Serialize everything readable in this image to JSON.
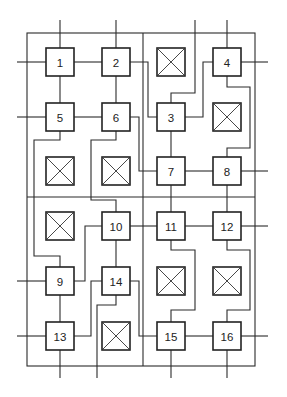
{
  "diagram": {
    "type": "grid-interconnect",
    "frame": {
      "left": 27,
      "top": 33,
      "right": 255,
      "bottom": 366,
      "divider_x": 143,
      "divider_y": 197
    },
    "box_size": 28,
    "nodes": [
      {
        "id": "1",
        "label": "1",
        "cx": 60,
        "cy": 62
      },
      {
        "id": "2",
        "label": "2",
        "cx": 116,
        "cy": 62
      },
      {
        "id": "4",
        "label": "4",
        "cx": 227,
        "cy": 62
      },
      {
        "id": "5",
        "label": "5",
        "cx": 60,
        "cy": 117
      },
      {
        "id": "6",
        "label": "6",
        "cx": 116,
        "cy": 117
      },
      {
        "id": "3",
        "label": "3",
        "cx": 171,
        "cy": 117
      },
      {
        "id": "7",
        "label": "7",
        "cx": 171,
        "cy": 171
      },
      {
        "id": "8",
        "label": "8",
        "cx": 227,
        "cy": 171
      },
      {
        "id": "10",
        "label": "10",
        "cx": 116,
        "cy": 226
      },
      {
        "id": "11",
        "label": "11",
        "cx": 171,
        "cy": 226
      },
      {
        "id": "12",
        "label": "12",
        "cx": 227,
        "cy": 226
      },
      {
        "id": "9",
        "label": "9",
        "cx": 60,
        "cy": 281
      },
      {
        "id": "14",
        "label": "14",
        "cx": 116,
        "cy": 281
      },
      {
        "id": "13",
        "label": "13",
        "cx": 60,
        "cy": 336
      },
      {
        "id": "15",
        "label": "15",
        "cx": 171,
        "cy": 336
      },
      {
        "id": "16",
        "label": "16",
        "cx": 227,
        "cy": 336
      }
    ],
    "empty_cells": [
      {
        "id": "x-r1c3",
        "cx": 171,
        "cy": 62
      },
      {
        "id": "x-r2c4",
        "cx": 227,
        "cy": 117
      },
      {
        "id": "x-r3c1",
        "cx": 60,
        "cy": 171
      },
      {
        "id": "x-r3c2",
        "cx": 116,
        "cy": 171
      },
      {
        "id": "x-r4c1",
        "cx": 60,
        "cy": 226
      },
      {
        "id": "x-r5c3",
        "cx": 171,
        "cy": 281
      },
      {
        "id": "x-r5c4",
        "cx": 227,
        "cy": 281
      },
      {
        "id": "x-r6c2",
        "cx": 116,
        "cy": 336
      }
    ],
    "wires": [
      {
        "id": "in-1-top",
        "points": [
          [
            60,
            20
          ],
          [
            60,
            48
          ]
        ]
      },
      {
        "id": "in-1-left",
        "points": [
          [
            17,
            62
          ],
          [
            46,
            62
          ]
        ]
      },
      {
        "id": "w-1-2",
        "points": [
          [
            74,
            62
          ],
          [
            102,
            62
          ]
        ]
      },
      {
        "id": "w-1-5",
        "points": [
          [
            60,
            76
          ],
          [
            60,
            103
          ]
        ]
      },
      {
        "id": "in-2-top",
        "points": [
          [
            116,
            20
          ],
          [
            116,
            48
          ]
        ]
      },
      {
        "id": "w-2-6",
        "points": [
          [
            116,
            76
          ],
          [
            116,
            103
          ]
        ]
      },
      {
        "id": "w-2-3",
        "points": [
          [
            130,
            62
          ],
          [
            148,
            62
          ],
          [
            148,
            117
          ],
          [
            157,
            117
          ]
        ]
      },
      {
        "id": "in-5-left",
        "points": [
          [
            17,
            117
          ],
          [
            46,
            117
          ]
        ]
      },
      {
        "id": "w-5-6",
        "points": [
          [
            74,
            117
          ],
          [
            102,
            117
          ]
        ]
      },
      {
        "id": "w-6-7",
        "points": [
          [
            130,
            117
          ],
          [
            139,
            117
          ],
          [
            139,
            171
          ],
          [
            157,
            171
          ]
        ]
      },
      {
        "id": "w-3-top",
        "points": [
          [
            171,
            103
          ],
          [
            171,
            93
          ],
          [
            195,
            93
          ],
          [
            195,
            20
          ]
        ]
      },
      {
        "id": "w-4-3",
        "points": [
          [
            213,
            62
          ],
          [
            203,
            62
          ],
          [
            203,
            117
          ],
          [
            185,
            117
          ]
        ]
      },
      {
        "id": "in-4-top",
        "points": [
          [
            227,
            20
          ],
          [
            227,
            48
          ]
        ]
      },
      {
        "id": "out-4-right",
        "points": [
          [
            241,
            62
          ],
          [
            268,
            62
          ]
        ]
      },
      {
        "id": "w-4-8",
        "points": [
          [
            227,
            76
          ],
          [
            227,
            87
          ],
          [
            250,
            87
          ],
          [
            250,
            148
          ],
          [
            227,
            148
          ],
          [
            227,
            157
          ]
        ]
      },
      {
        "id": "w-3-7",
        "points": [
          [
            171,
            131
          ],
          [
            171,
            157
          ]
        ]
      },
      {
        "id": "w-7-8",
        "points": [
          [
            185,
            171
          ],
          [
            213,
            171
          ]
        ]
      },
      {
        "id": "out-8-right",
        "points": [
          [
            241,
            171
          ],
          [
            268,
            171
          ]
        ]
      },
      {
        "id": "w-7-11",
        "points": [
          [
            171,
            185
          ],
          [
            171,
            212
          ]
        ]
      },
      {
        "id": "w-8-12",
        "points": [
          [
            227,
            185
          ],
          [
            227,
            212
          ]
        ]
      },
      {
        "id": "w-5-9",
        "points": [
          [
            60,
            131
          ],
          [
            60,
            140
          ],
          [
            34,
            140
          ],
          [
            34,
            256
          ],
          [
            60,
            256
          ],
          [
            60,
            267
          ]
        ]
      },
      {
        "id": "w-6-10",
        "points": [
          [
            116,
            131
          ],
          [
            116,
            140
          ],
          [
            91,
            140
          ],
          [
            91,
            200
          ],
          [
            116,
            200
          ],
          [
            116,
            212
          ]
        ]
      },
      {
        "id": "w-10-11",
        "points": [
          [
            130,
            226
          ],
          [
            157,
            226
          ]
        ]
      },
      {
        "id": "w-11-12",
        "points": [
          [
            185,
            226
          ],
          [
            213,
            226
          ]
        ]
      },
      {
        "id": "out-12-right",
        "points": [
          [
            241,
            226
          ],
          [
            268,
            226
          ]
        ]
      },
      {
        "id": "w-10-9",
        "points": [
          [
            102,
            226
          ],
          [
            85,
            226
          ],
          [
            85,
            281
          ],
          [
            74,
            281
          ]
        ]
      },
      {
        "id": "w-10-14",
        "points": [
          [
            116,
            240
          ],
          [
            116,
            267
          ]
        ]
      },
      {
        "id": "in-9-left",
        "points": [
          [
            17,
            281
          ],
          [
            46,
            281
          ]
        ]
      },
      {
        "id": "w-9-13",
        "points": [
          [
            60,
            295
          ],
          [
            60,
            322
          ]
        ]
      },
      {
        "id": "w-14-13",
        "points": [
          [
            102,
            281
          ],
          [
            91,
            281
          ],
          [
            91,
            336
          ],
          [
            74,
            336
          ]
        ]
      },
      {
        "id": "w-14-bottom",
        "points": [
          [
            116,
            295
          ],
          [
            116,
            305
          ],
          [
            97,
            305
          ],
          [
            97,
            378
          ]
        ]
      },
      {
        "id": "w-14-15",
        "points": [
          [
            130,
            281
          ],
          [
            139,
            281
          ],
          [
            139,
            336
          ],
          [
            157,
            336
          ]
        ]
      },
      {
        "id": "w-11-15",
        "points": [
          [
            171,
            240
          ],
          [
            171,
            250
          ],
          [
            195,
            250
          ],
          [
            195,
            310
          ],
          [
            171,
            310
          ],
          [
            171,
            322
          ]
        ]
      },
      {
        "id": "w-12-16",
        "points": [
          [
            227,
            240
          ],
          [
            227,
            250
          ],
          [
            250,
            250
          ],
          [
            250,
            310
          ],
          [
            227,
            310
          ],
          [
            227,
            322
          ]
        ]
      },
      {
        "id": "in-13-left",
        "points": [
          [
            17,
            336
          ],
          [
            46,
            336
          ]
        ]
      },
      {
        "id": "out-13-bottom",
        "points": [
          [
            60,
            350
          ],
          [
            60,
            378
          ]
        ]
      },
      {
        "id": "w-15-16",
        "points": [
          [
            185,
            336
          ],
          [
            213,
            336
          ]
        ]
      },
      {
        "id": "out-15-bottom",
        "points": [
          [
            171,
            350
          ],
          [
            171,
            378
          ]
        ]
      },
      {
        "id": "out-16-right",
        "points": [
          [
            241,
            336
          ],
          [
            268,
            336
          ]
        ]
      },
      {
        "id": "out-16-bottom",
        "points": [
          [
            227,
            350
          ],
          [
            227,
            378
          ]
        ]
      }
    ]
  }
}
